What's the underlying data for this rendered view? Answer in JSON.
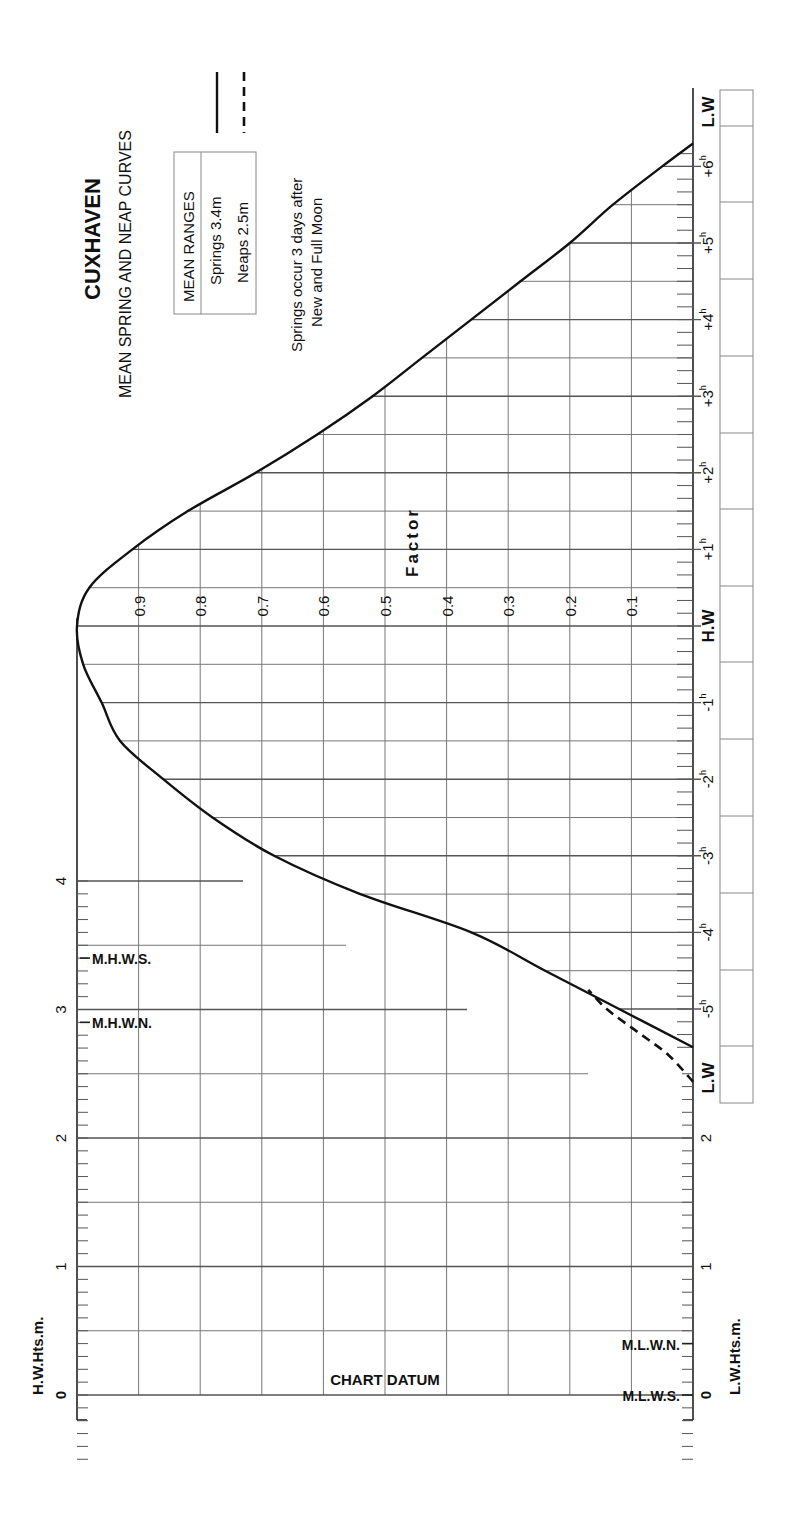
{
  "title": {
    "port": "CUXHAVEN",
    "subtitle": "MEAN SPRING AND NEAP CURVES",
    "mean_ranges_header": "MEAN RANGES",
    "springs_range": "Springs 3.4m",
    "neaps_range": "Neaps 2.5m",
    "note_line1": "Springs occur 3 days after",
    "note_line2": "New and Full Moon"
  },
  "axes": {
    "left_label": "H.W.Hts.m.",
    "right_label": "L.W.Hts.m.",
    "factor_label": "Factor",
    "chart_datum_label": "CHART DATUM",
    "height_ticks": [
      "0",
      "1",
      "2",
      "3",
      "4"
    ],
    "right_height_ticks": [
      "0",
      "1",
      "2"
    ],
    "factor_ticks": [
      "0.9",
      "0.8",
      "0.7",
      "0.6",
      "0.5",
      "0.4",
      "0.3",
      "0.2",
      "0.1"
    ],
    "time_labels": {
      "lw_top": "L.W",
      "p6": "+6h",
      "p5": "+5h",
      "p4": "+4h",
      "p3": "+3h",
      "p2": "+2h",
      "p1": "+1h",
      "hw": "H.W",
      "m1": "-1h",
      "m2": "-2h",
      "m3": "-3h",
      "m4": "-4h",
      "m5": "-5h",
      "lw_bottom": "L.W"
    },
    "level_labels": {
      "mhws": "M.H.W.S.",
      "mhwn": "M.H.W.N.",
      "mlwn": "M.L.W.N.",
      "mlws": "M.L.W.S."
    }
  },
  "legend": {
    "springs_style": "solid",
    "neaps_style": "dashed"
  },
  "chart_data": {
    "type": "line",
    "orientation": "rotated 90deg (time axis vertical, factor horizontal)",
    "xlabel": "Time relative to H.W (hours)",
    "ylabel": "Factor",
    "x": [
      -5.5,
      -5,
      -4.5,
      -4,
      -3.5,
      -3,
      -2.5,
      -2,
      -1.5,
      -1,
      -0.5,
      0,
      0.5,
      1,
      1.5,
      2,
      2.5,
      3,
      3.5,
      4,
      4.5,
      5,
      5.5,
      6,
      6.3
    ],
    "series": [
      {
        "name": "Springs (3.4m)",
        "style": "solid",
        "values": [
          0.0,
          0.12,
          0.24,
          0.36,
          0.54,
          0.68,
          0.78,
          0.86,
          0.93,
          0.96,
          0.99,
          1.0,
          0.98,
          0.91,
          0.82,
          0.71,
          0.61,
          0.52,
          0.44,
          0.36,
          0.28,
          0.2,
          0.13,
          0.05,
          0.0
        ]
      },
      {
        "name": "Neaps (2.5m)",
        "style": "dashed",
        "x": [
          -5.95,
          -5.6,
          -5.3,
          -5.0,
          -4.75
        ],
        "values": [
          0.0,
          0.04,
          0.09,
          0.14,
          0.17
        ]
      }
    ],
    "factor_range": [
      0,
      1
    ],
    "height_scale": {
      "hw_heights_m": [
        0,
        1,
        2,
        3,
        4
      ],
      "lw_heights_m": [
        0,
        1,
        2
      ],
      "MHWS": 3.4,
      "MHWN": 2.9,
      "MLWN": 0.4,
      "MLWS": 0.0
    },
    "mean_ranges": {
      "springs_m": 3.4,
      "neaps_m": 2.5
    },
    "grid": true
  }
}
